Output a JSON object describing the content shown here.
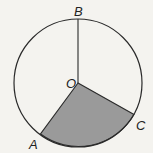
{
  "diagram": {
    "type": "circle-sector",
    "labels": {
      "center": "O",
      "top": "B",
      "left_point": "A",
      "right_point": "C"
    },
    "colors": {
      "background": "#f4f3ef",
      "stroke": "#2a2a2a",
      "shaded_sector": "#9a9a9a"
    },
    "shaded_sector": "AOC"
  }
}
